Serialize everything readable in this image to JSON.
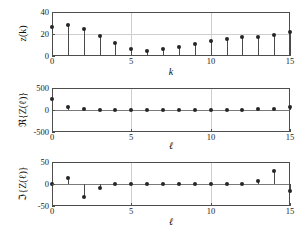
{
  "figure": {
    "background_color": "#ffffff",
    "axis_color": "#4d4d4d",
    "grid_color": "#cfcfcf",
    "marker_color": "#262626",
    "stem_color": "#4a4a4a",
    "width": 308,
    "height": 232
  },
  "chart_data": [
    {
      "type": "bar",
      "subtype": "stem",
      "title": "",
      "xlabel": "k",
      "ylabel": "z(k)",
      "xlim": [
        0,
        15
      ],
      "ylim": [
        0,
        40
      ],
      "xticks": [
        0,
        5,
        10,
        15
      ],
      "xticklabels": [
        "0",
        "5",
        "10",
        "15"
      ],
      "yticks": [
        0,
        20,
        40
      ],
      "yticklabels": [
        "0",
        "20",
        "40"
      ],
      "grid": true,
      "legend": null,
      "x": [
        0,
        1,
        2,
        3,
        4,
        5,
        6,
        7,
        8,
        9,
        10,
        11,
        12,
        13,
        14,
        15
      ],
      "values": [
        26,
        28,
        25,
        18.5,
        11.5,
        6,
        5,
        6,
        8,
        11,
        13.5,
        15.5,
        17,
        17.5,
        19.5,
        22
      ],
      "baseline": 0
    },
    {
      "type": "bar",
      "subtype": "stem",
      "title": "",
      "xlabel": "ℓ",
      "ylabel": "ℜ{Z(ℓ)}",
      "xlim": [
        0,
        15
      ],
      "ylim": [
        -500,
        500
      ],
      "xticks": [
        0,
        5,
        10,
        15
      ],
      "xticklabels": [
        "0",
        "5",
        "10",
        "15"
      ],
      "yticks": [
        -500,
        0,
        500
      ],
      "yticklabels": [
        "-500",
        "0",
        "500"
      ],
      "grid": true,
      "legend": null,
      "x": [
        0,
        1,
        2,
        3,
        4,
        5,
        6,
        7,
        8,
        9,
        10,
        11,
        12,
        13,
        14,
        15
      ],
      "values": [
        245,
        62,
        18,
        10,
        8,
        6,
        6,
        6,
        6,
        6,
        6,
        8,
        10,
        14,
        24,
        66
      ],
      "baseline": 0
    },
    {
      "type": "bar",
      "subtype": "stem",
      "title": "",
      "xlabel": "ℓ",
      "ylabel": "ℑ{Z(ℓ)}",
      "xlim": [
        0,
        15
      ],
      "ylim": [
        -50,
        50
      ],
      "xticks": [
        0,
        5,
        10,
        15
      ],
      "xticklabels": [
        "0",
        "5",
        "10",
        "15"
      ],
      "yticks": [
        -50,
        0,
        50
      ],
      "yticklabels": [
        "-50",
        "0",
        "50"
      ],
      "grid": true,
      "legend": null,
      "x": [
        0,
        1,
        2,
        3,
        4,
        5,
        6,
        7,
        8,
        9,
        10,
        11,
        12,
        13,
        14,
        15
      ],
      "values": [
        0,
        14,
        -29,
        -8,
        -1,
        0,
        0,
        0,
        0,
        0,
        0,
        0,
        0,
        7,
        29,
        -15
      ],
      "baseline": 0
    }
  ]
}
